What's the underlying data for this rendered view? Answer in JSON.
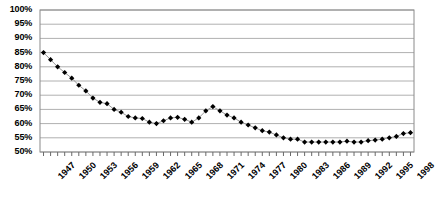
{
  "chart_data": {
    "type": "line",
    "title": "",
    "xlabel": "",
    "ylabel": "",
    "ylim": [
      50,
      100
    ],
    "ytick_step": 5,
    "ytick_labels": [
      "100%",
      "95%",
      "90%",
      "85%",
      "80%",
      "75%",
      "70%",
      "65%",
      "60%",
      "55%",
      "50%"
    ],
    "grid": true,
    "legend": false,
    "marker": "diamond",
    "marker_color": "#000000",
    "line_color": "#999999",
    "xtick_labels": [
      "1947",
      "1950",
      "1953",
      "1956",
      "1959",
      "1962",
      "1965",
      "1968",
      "1971",
      "1974",
      "1977",
      "1980",
      "1983",
      "1986",
      "1989",
      "1992",
      "1995",
      "1998"
    ],
    "xtick_step_years": 3,
    "x": [
      1947,
      1948,
      1949,
      1950,
      1951,
      1952,
      1953,
      1954,
      1955,
      1956,
      1957,
      1958,
      1959,
      1960,
      1961,
      1962,
      1963,
      1964,
      1965,
      1966,
      1967,
      1968,
      1969,
      1970,
      1971,
      1972,
      1973,
      1974,
      1975,
      1976,
      1977,
      1978,
      1979,
      1980,
      1981,
      1982,
      1983,
      1984,
      1985,
      1986,
      1987,
      1988,
      1989,
      1990,
      1991,
      1992,
      1993,
      1994,
      1995,
      1996,
      1997,
      1998,
      1999
    ],
    "values": [
      85.0,
      82.5,
      80.0,
      78.0,
      76.0,
      73.5,
      71.5,
      69.0,
      67.5,
      67.0,
      65.0,
      64.0,
      62.5,
      62.0,
      61.8,
      60.5,
      60.0,
      61.0,
      62.0,
      62.2,
      61.5,
      60.5,
      62.0,
      64.5,
      66.0,
      64.5,
      63.0,
      62.0,
      60.5,
      59.5,
      58.5,
      57.5,
      57.0,
      56.0,
      55.0,
      54.5,
      54.5,
      53.5,
      53.5,
      53.5,
      53.5,
      53.5,
      53.5,
      53.8,
      53.5,
      53.5,
      54.0,
      54.2,
      54.5,
      55.0,
      55.5,
      56.5,
      56.8
    ]
  },
  "axes": {
    "plot_left": 40,
    "plot_right": 414,
    "plot_top": 10,
    "plot_bottom": 152
  }
}
